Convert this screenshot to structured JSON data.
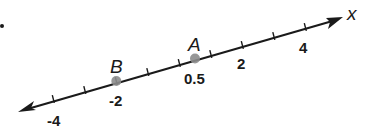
{
  "diagram": {
    "type": "number_line",
    "axis_label": "x",
    "tick_labels": [
      {
        "value": -4,
        "text": "-4"
      },
      {
        "value": -2,
        "text": "-2"
      },
      {
        "value": 0.5,
        "text": "0.5"
      },
      {
        "value": 2,
        "text": "2"
      },
      {
        "value": 4,
        "text": "4"
      }
    ],
    "tick_values": [
      -4,
      -3,
      -2,
      -1,
      0,
      1,
      2,
      3,
      4
    ],
    "points": [
      {
        "name": "B",
        "value": -2
      },
      {
        "name": "A",
        "value": 0.5
      }
    ],
    "colors": {
      "line": "#1a1a1a",
      "point": "#8c8c8c"
    }
  }
}
